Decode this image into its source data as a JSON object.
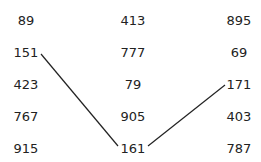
{
  "columns": [
    {
      "values": [
        "89",
        "151",
        "423",
        "767",
        "915"
      ]
    },
    {
      "values": [
        "413",
        "777",
        "79",
        "905",
        "161"
      ]
    },
    {
      "values": [
        "895",
        "69",
        "171",
        "403",
        "787"
      ]
    }
  ],
  "connections": [
    {
      "from": "151",
      "to": "161"
    },
    {
      "from": "161",
      "to": "171"
    }
  ],
  "colors": {
    "text": "#222222",
    "line": "#222222",
    "background": "#ffffff"
  }
}
